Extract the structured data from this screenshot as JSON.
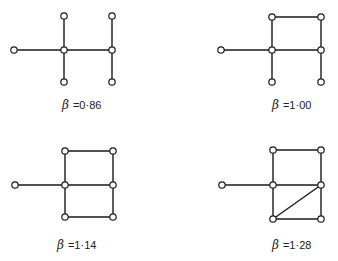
{
  "figure": {
    "panels": [
      {
        "id": "a",
        "symbol": "β",
        "value_text": "=0·86",
        "label_pos": [
          62,
          98
        ],
        "nodes": [
          [
            14,
            50
          ],
          [
            64,
            50
          ],
          [
            64,
            16
          ],
          [
            64,
            82
          ],
          [
            112,
            50
          ],
          [
            112,
            16
          ],
          [
            112,
            82
          ]
        ],
        "edges": [
          [
            0,
            1
          ],
          [
            1,
            2
          ],
          [
            1,
            3
          ],
          [
            1,
            4
          ],
          [
            4,
            5
          ],
          [
            4,
            6
          ]
        ]
      },
      {
        "id": "b",
        "symbol": "β",
        "value_text": "=1·00",
        "label_pos": [
          272,
          98
        ],
        "nodes": [
          [
            221,
            50
          ],
          [
            272,
            50
          ],
          [
            272,
            17
          ],
          [
            321,
            50
          ],
          [
            321,
            17
          ],
          [
            272,
            82
          ],
          [
            321,
            82
          ]
        ],
        "edges": [
          [
            0,
            1
          ],
          [
            1,
            2
          ],
          [
            2,
            4
          ],
          [
            4,
            3
          ],
          [
            1,
            3
          ],
          [
            1,
            5
          ],
          [
            3,
            6
          ]
        ]
      },
      {
        "id": "c",
        "symbol": "β",
        "value_text": "=1·14",
        "label_pos": [
          57,
          238
        ],
        "nodes": [
          [
            15,
            185
          ],
          [
            65,
            185
          ],
          [
            65,
            151
          ],
          [
            65,
            217
          ],
          [
            113,
            185
          ],
          [
            113,
            151
          ],
          [
            113,
            217
          ]
        ],
        "edges": [
          [
            0,
            1
          ],
          [
            1,
            2
          ],
          [
            2,
            5
          ],
          [
            5,
            4
          ],
          [
            1,
            4
          ],
          [
            1,
            3
          ],
          [
            3,
            6
          ],
          [
            6,
            4
          ]
        ]
      },
      {
        "id": "d",
        "symbol": "β",
        "value_text": "=1·28",
        "label_pos": [
          272,
          238
        ],
        "nodes": [
          [
            222,
            185
          ],
          [
            273,
            185
          ],
          [
            273,
            150
          ],
          [
            321,
            150
          ],
          [
            321,
            185
          ],
          [
            273,
            219
          ],
          [
            321,
            219
          ]
        ],
        "edges": [
          [
            0,
            1
          ],
          [
            1,
            2
          ],
          [
            2,
            3
          ],
          [
            3,
            4
          ],
          [
            1,
            4
          ],
          [
            1,
            5
          ],
          [
            5,
            6
          ],
          [
            6,
            4
          ],
          [
            5,
            4
          ]
        ]
      }
    ]
  }
}
